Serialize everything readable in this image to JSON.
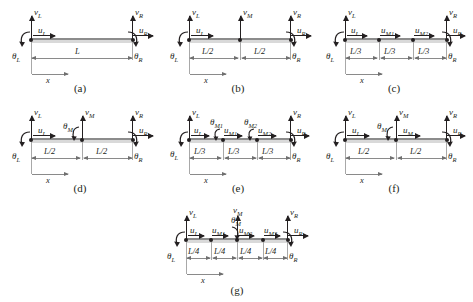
{
  "figure": {
    "beam_color": "#d9d9d9",
    "beam_edge_color": "#8c8c8c",
    "ink_color": "#231f20",
    "dim_color": "#8a8a8a"
  },
  "symbols": {
    "vL": "v",
    "vL_sub": "L",
    "vM": "v",
    "vM_sub": "M",
    "vR": "v",
    "vR_sub": "R",
    "uL": "u",
    "uL_sub": "L",
    "uM": "u",
    "uM_sub": "M",
    "uM1": "u",
    "uM1_sub": "M1",
    "uM2": "u",
    "uM2_sub": "M2",
    "uM3": "u",
    "uM3_sub": "M3",
    "uR": "u",
    "uR_sub": "R",
    "thL": "θ",
    "thL_sub": "L",
    "thM": "θ",
    "thM_sub": "M",
    "thM1": "θ",
    "thM1_sub": "M1",
    "thM2": "θ",
    "thM2_sub": "M2",
    "thR": "θ",
    "thR_sub": "R",
    "x_axis": "x"
  },
  "panels": [
    {
      "id": "a",
      "caption": "(a)",
      "segments": [
        "L"
      ],
      "nodes": [
        "left",
        "right"
      ],
      "dofs_left": [
        "u_L",
        "v_L",
        "theta_L"
      ],
      "dofs_middle": [],
      "dofs_right": [
        "u_R",
        "v_R",
        "theta_R"
      ],
      "labels": {
        "vL": "v",
        "vL_sub": "L",
        "uL": "u",
        "uL_sub": "L",
        "thL": "θ",
        "thL_sub": "L",
        "vR": "v",
        "vR_sub": "R",
        "uR": "u",
        "uR_sub": "R",
        "thR": "θ",
        "thR_sub": "R",
        "dim1": "L",
        "x": "x"
      }
    },
    {
      "id": "b",
      "caption": "(b)",
      "segments": [
        "L/2",
        "L/2"
      ],
      "nodes": [
        "left",
        "mid",
        "right"
      ],
      "dofs_middle": [
        "v_M"
      ],
      "labels": {
        "vL": "v",
        "vL_sub": "L",
        "uL": "u",
        "uL_sub": "L",
        "thL": "θ",
        "thL_sub": "L",
        "vM": "v",
        "vM_sub": "M",
        "vR": "v",
        "vR_sub": "R",
        "uR": "u",
        "uR_sub": "R",
        "thR": "θ",
        "thR_sub": "R",
        "dim1": "L/2",
        "dim2": "L/2",
        "x": "x"
      }
    },
    {
      "id": "c",
      "caption": "(c)",
      "segments": [
        "L/3",
        "L/3",
        "L/3"
      ],
      "nodes": [
        "left",
        "mid1",
        "mid2",
        "right"
      ],
      "dofs_middle": [
        "u_M1",
        "u_M2"
      ],
      "labels": {
        "vL": "v",
        "vL_sub": "L",
        "uL": "u",
        "uL_sub": "L",
        "thL": "θ",
        "thL_sub": "L",
        "uM1": "u",
        "uM1_sub": "M1",
        "uM2": "u",
        "uM2_sub": "M2",
        "vR": "v",
        "vR_sub": "R",
        "uR": "u",
        "uR_sub": "R",
        "thR": "θ",
        "thR_sub": "R",
        "dim1": "L/3",
        "dim2": "L/3",
        "dim3": "L/3",
        "x": "x"
      }
    },
    {
      "id": "d",
      "caption": "(d)",
      "segments": [
        "L/2",
        "L/2"
      ],
      "nodes": [
        "left",
        "mid",
        "right"
      ],
      "dofs_middle": [
        "v_M",
        "theta_M"
      ],
      "labels": {
        "vL": "v",
        "vL_sub": "L",
        "uL": "u",
        "uL_sub": "L",
        "thL": "θ",
        "thL_sub": "L",
        "vM": "v",
        "vM_sub": "M",
        "thM": "θ",
        "thM_sub": "M",
        "vR": "v",
        "vR_sub": "R",
        "uR": "u",
        "uR_sub": "R",
        "thR": "θ",
        "thR_sub": "R",
        "dim1": "L/2",
        "dim2": "L/2",
        "x": "x"
      }
    },
    {
      "id": "e",
      "caption": "(e)",
      "segments": [
        "L/3",
        "L/3",
        "L/3"
      ],
      "nodes": [
        "left",
        "mid1",
        "mid2",
        "right"
      ],
      "dofs_middle": [
        "theta_M1",
        "u_M1",
        "theta_M2",
        "u_M2"
      ],
      "labels": {
        "vL": "v",
        "vL_sub": "L",
        "uL": "u",
        "uL_sub": "L",
        "thL": "θ",
        "thL_sub": "L",
        "thM1": "θ",
        "thM1_sub": "M1",
        "uM1": "u",
        "uM1_sub": "M1",
        "thM2": "θ",
        "thM2_sub": "M2",
        "uM2": "u",
        "uM2_sub": "M2",
        "vR": "v",
        "vR_sub": "R",
        "uR": "u",
        "uR_sub": "R",
        "thR": "θ",
        "thR_sub": "R",
        "dim1": "L/3",
        "dim2": "L/3",
        "dim3": "L/3",
        "x": "x"
      }
    },
    {
      "id": "f",
      "caption": "(f)",
      "segments": [
        "L/2",
        "L/2"
      ],
      "nodes": [
        "left",
        "mid",
        "right"
      ],
      "dofs_middle": [
        "v_M",
        "theta_M",
        "u_M"
      ],
      "labels": {
        "vL": "v",
        "vL_sub": "L",
        "uL": "u",
        "uL_sub": "L",
        "thL": "θ",
        "thL_sub": "L",
        "vM": "v",
        "vM_sub": "M",
        "thM": "θ",
        "thM_sub": "M",
        "uM": "u",
        "uM_sub": "M",
        "vR": "v",
        "vR_sub": "R",
        "uR": "u",
        "uR_sub": "R",
        "thR": "θ",
        "thR_sub": "R",
        "dim1": "L/2",
        "dim2": "L/2",
        "x": "x"
      }
    },
    {
      "id": "g",
      "caption": "(g)",
      "segments": [
        "L/4",
        "L/4",
        "L/4",
        "L/4"
      ],
      "nodes": [
        "left",
        "mid1",
        "mid2",
        "mid3",
        "right"
      ],
      "dofs_middle": [
        "u_M1",
        "v_M",
        "theta_M",
        "u_M2",
        "u_M3"
      ],
      "labels": {
        "vL": "v",
        "vL_sub": "L",
        "uL": "u",
        "uL_sub": "L",
        "thL": "θ",
        "thL_sub": "L",
        "uM1": "u",
        "uM1_sub": "M1",
        "vM": "v",
        "vM_sub": "M",
        "thM": "θ",
        "thM_sub": "M",
        "uM2": "u",
        "uM2_sub": "M2",
        "uM3": "u",
        "uM3_sub": "M3",
        "vR": "v",
        "vR_sub": "R",
        "uR": "u",
        "uR_sub": "R",
        "thR": "θ",
        "thR_sub": "R",
        "dim1": "L/4",
        "dim2": "L/4",
        "dim3": "L/4",
        "dim4": "L/4",
        "x": "x"
      }
    }
  ]
}
